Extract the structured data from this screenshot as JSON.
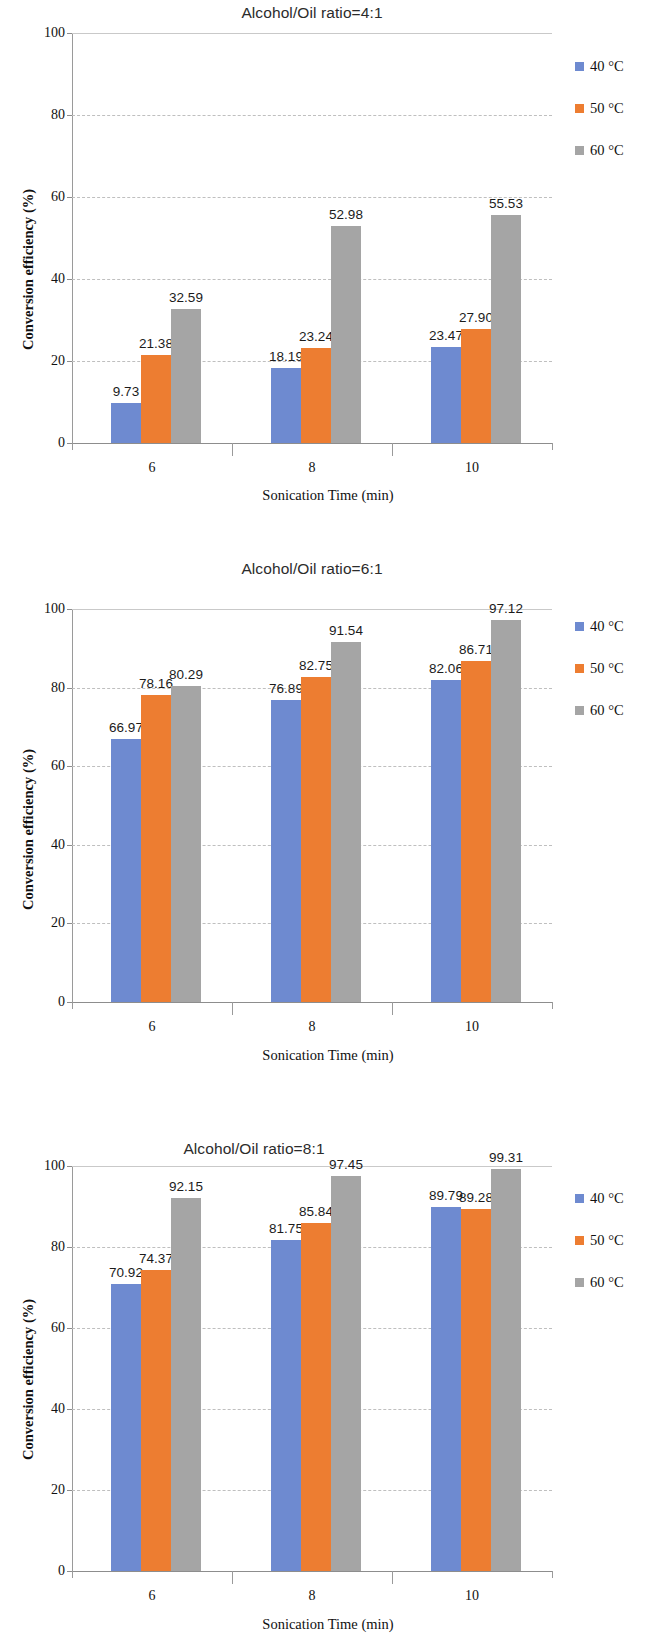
{
  "figure": {
    "series_colors": {
      "40 °C": "#6E8AD0",
      "50 °C": "#ED7D31",
      "60 °C": "#A5A5A5"
    },
    "legend_labels": [
      "40 °C",
      "50 °C",
      "60 °C"
    ],
    "xlabel": "Sonication Time (min)",
    "ylabel": "Conversion efficiency (%)"
  },
  "chart_data": [
    {
      "type": "bar",
      "title": "Alcohol/Oil ratio=4:1",
      "xlabel": "Sonication Time (min)",
      "ylabel": "Conversion efficiency (%)",
      "categories": [
        "6",
        "8",
        "10"
      ],
      "ylim": [
        0,
        100
      ],
      "yticks": [
        "0",
        "20",
        "40",
        "60",
        "80",
        "100"
      ],
      "grid": true,
      "legend_position": "right",
      "series": [
        {
          "name": "40 °C",
          "values": [
            9.73,
            18.19,
            23.47
          ],
          "labels": [
            "9.73",
            "18.19",
            "23.47"
          ]
        },
        {
          "name": "50 °C",
          "values": [
            21.38,
            23.24,
            27.9
          ],
          "labels": [
            "21.38",
            "23.24",
            "27.90"
          ]
        },
        {
          "name": "60 °C",
          "values": [
            32.59,
            52.98,
            55.53
          ],
          "labels": [
            "32.59",
            "52.98",
            "55.53"
          ]
        }
      ]
    },
    {
      "type": "bar",
      "title": "Alcohol/Oil ratio=6:1",
      "xlabel": "Sonication Time (min)",
      "ylabel": "Conversion efficiency (%)",
      "categories": [
        "6",
        "8",
        "10"
      ],
      "ylim": [
        0,
        100
      ],
      "yticks": [
        "0",
        "20",
        "40",
        "60",
        "80",
        "100"
      ],
      "grid": true,
      "legend_position": "right",
      "series": [
        {
          "name": "40 °C",
          "values": [
            66.97,
            76.89,
            82.06
          ],
          "labels": [
            "66.97",
            "76.89",
            "82.06"
          ]
        },
        {
          "name": "50 °C",
          "values": [
            78.16,
            82.75,
            86.71
          ],
          "labels": [
            "78.16",
            "82.75",
            "86.71"
          ]
        },
        {
          "name": "60 °C",
          "values": [
            80.29,
            91.54,
            97.12
          ],
          "labels": [
            "80.29",
            "91.54",
            "97.12"
          ]
        }
      ]
    },
    {
      "type": "bar",
      "title": "Alcohol/Oil ratio=8:1",
      "xlabel": "Sonication Time (min)",
      "ylabel": "Conversion efficiency (%)",
      "categories": [
        "6",
        "8",
        "10"
      ],
      "ylim": [
        0,
        100
      ],
      "yticks": [
        "0",
        "20",
        "40",
        "60",
        "80",
        "100"
      ],
      "grid": true,
      "legend_position": "right",
      "series": [
        {
          "name": "40 °C",
          "values": [
            70.92,
            81.75,
            89.79
          ],
          "labels": [
            "70.92",
            "81.75",
            "89.79"
          ]
        },
        {
          "name": "50 °C",
          "values": [
            74.37,
            85.84,
            89.28
          ],
          "labels": [
            "74.37",
            "85.84",
            "89.28"
          ]
        },
        {
          "name": "60 °C",
          "values": [
            92.15,
            97.45,
            99.31
          ],
          "labels": [
            "92.15",
            "97.45",
            "99.31"
          ]
        }
      ]
    }
  ]
}
